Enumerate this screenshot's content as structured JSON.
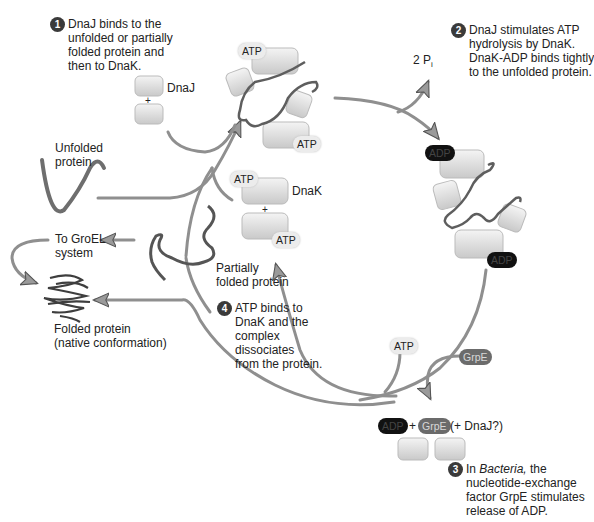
{
  "steps": [
    {
      "number": "1",
      "lines": [
        "DnaJ binds to the",
        "unfolded or partially",
        "folded protein and",
        "then to DnaK."
      ]
    },
    {
      "number": "2",
      "lines": [
        "DnaJ stimulates ATP",
        "hydrolysis by DnaK.",
        "DnaK-ADP binds tightly",
        "to the unfolded protein."
      ]
    },
    {
      "number": "3",
      "lines_pre": "In ",
      "italic": "Bacteria,",
      "line1_post": " the",
      "lines": [
        "nucleotide-exchange",
        "factor GrpE stimulates",
        "release of ADP."
      ]
    },
    {
      "number": "4",
      "lines": [
        "ATP binds to",
        "DnaK and the",
        "complex",
        "dissociates",
        "from the protein."
      ]
    }
  ],
  "labels": {
    "dnaj": "DnaJ",
    "dnak": "DnaK",
    "plus": "+",
    "unfolded_protein": [
      "Unfolded",
      "protein"
    ],
    "partially_folded": [
      "Partially",
      "folded protein"
    ],
    "to_groel": [
      "To GroEL",
      "system"
    ],
    "folded_protein": [
      "Folded protein",
      "(native conformation)"
    ],
    "two_pi": "2 P",
    "two_pi_sub": "i",
    "exchange_eq": {
      "adp": "ADP",
      "plus": "+",
      "grpe": "GrpE",
      "dnaj_q": "(+ DnaJ?)"
    }
  },
  "molecules": {
    "atp": "ATP",
    "adp": "ADP",
    "grpe": "GrpE"
  },
  "colors": {
    "arrow": "#8a8a8a",
    "arrow_edge": "#5a5a5a",
    "protein_box": "#d9d9d9",
    "protein_ribbon": "#6e6e6e",
    "adp_fill": "#111111",
    "grpe_fill": "#6b6b6b",
    "badge_fill": "#3a3a3a"
  }
}
